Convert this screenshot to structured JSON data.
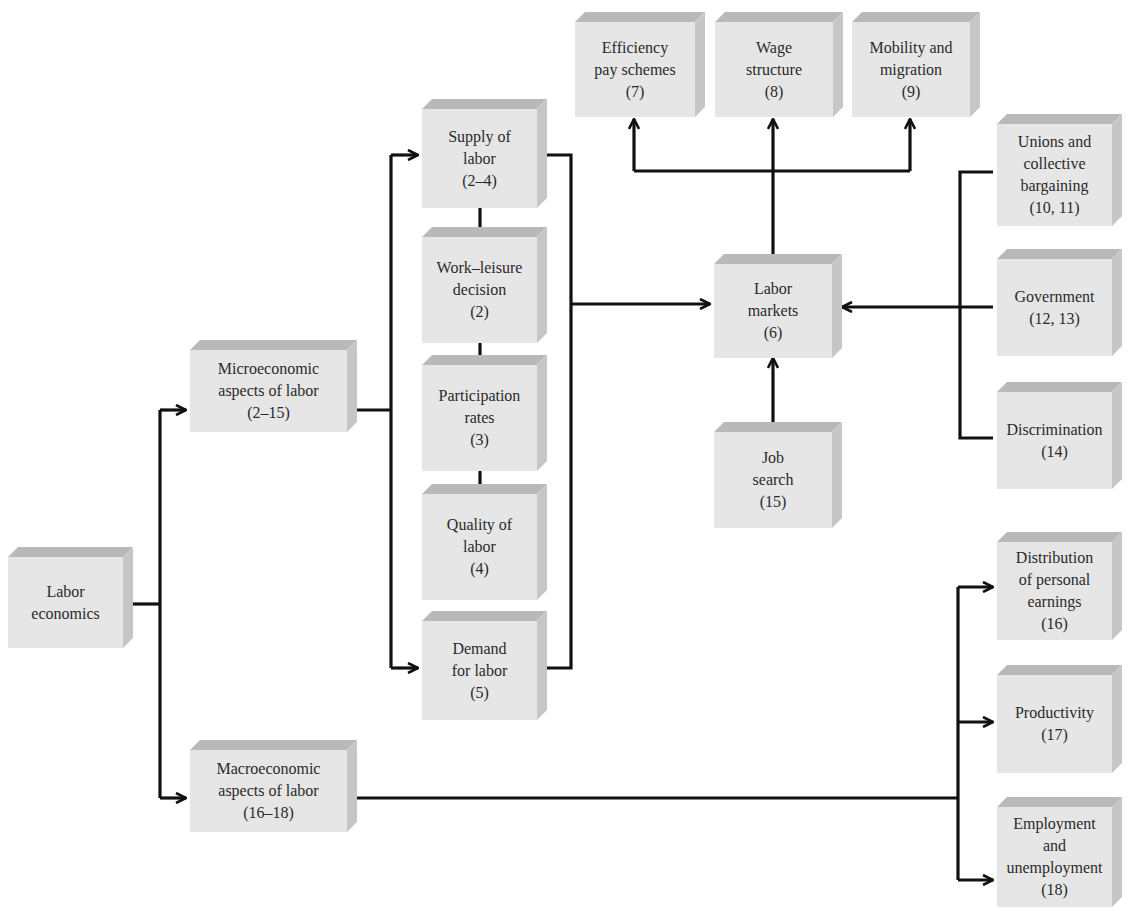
{
  "diagram": {
    "colors": {
      "box_face": "#e6e6e6",
      "box_top": "#b9b9b9",
      "box_side": "#c6c6c6",
      "line": "#111111",
      "text": "#2a2a2a"
    },
    "nodes": {
      "labor_economics": {
        "label": "Labor\neconomics"
      },
      "micro": {
        "label": "Microeconomic\naspects of labor\n(2–15)"
      },
      "macro": {
        "label": "Macroeconomic\naspects of labor\n(16–18)"
      },
      "supply": {
        "label": "Supply of\nlabor\n(2–4)"
      },
      "work_leisure": {
        "label": "Work–leisure\ndecision\n(2)"
      },
      "participation": {
        "label": "Participation\nrates\n(3)"
      },
      "quality": {
        "label": "Quality of\nlabor\n(4)"
      },
      "demand": {
        "label": "Demand\nfor labor\n(5)"
      },
      "labor_markets": {
        "label": "Labor\nmarkets\n(6)"
      },
      "efficiency": {
        "label": "Efficiency\npay schemes\n(7)"
      },
      "wage_structure": {
        "label": "Wage\nstructure\n(8)"
      },
      "mobility": {
        "label": "Mobility and\nmigration\n(9)"
      },
      "unions": {
        "label": "Unions and\ncollective\nbargaining\n(10, 11)"
      },
      "government": {
        "label": "Government\n(12, 13)"
      },
      "discrimination": {
        "label": "Discrimination\n(14)"
      },
      "job_search": {
        "label": "Job\nsearch\n(15)"
      },
      "distribution": {
        "label": "Distribution\nof personal\nearnings\n(16)"
      },
      "productivity": {
        "label": "Productivity\n(17)"
      },
      "employment": {
        "label": "Employment\nand\nunemployment\n(18)"
      }
    },
    "edges": [
      {
        "from": "labor_economics",
        "to": "micro",
        "arrow": true
      },
      {
        "from": "labor_economics",
        "to": "macro",
        "arrow": true
      },
      {
        "from": "micro",
        "to": "supply",
        "arrow": true
      },
      {
        "from": "micro",
        "to": "demand",
        "arrow": true
      },
      {
        "from": "supply",
        "to": "work_leisure",
        "arrow": false
      },
      {
        "from": "work_leisure",
        "to": "participation",
        "arrow": false
      },
      {
        "from": "participation",
        "to": "quality",
        "arrow": false
      },
      {
        "from": "supply",
        "to": "labor_markets",
        "arrow": true
      },
      {
        "from": "demand",
        "to": "labor_markets",
        "arrow": true
      },
      {
        "from": "labor_markets",
        "to": "efficiency",
        "arrow": true
      },
      {
        "from": "labor_markets",
        "to": "wage_structure",
        "arrow": true
      },
      {
        "from": "labor_markets",
        "to": "mobility",
        "arrow": true
      },
      {
        "from": "unions",
        "to": "labor_markets",
        "arrow": true
      },
      {
        "from": "government",
        "to": "labor_markets",
        "arrow": true
      },
      {
        "from": "discrimination",
        "to": "labor_markets",
        "arrow": true
      },
      {
        "from": "job_search",
        "to": "labor_markets",
        "arrow": true
      },
      {
        "from": "macro",
        "to": "distribution",
        "arrow": true
      },
      {
        "from": "macro",
        "to": "productivity",
        "arrow": true
      },
      {
        "from": "macro",
        "to": "employment",
        "arrow": true
      }
    ]
  }
}
